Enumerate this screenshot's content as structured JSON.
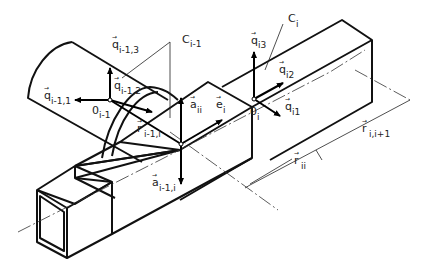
{
  "figure": {
    "labels": {
      "C_prev": {
        "base": "C",
        "sub": "i-1"
      },
      "C_curr": {
        "base": "C",
        "sub": "i"
      },
      "q_prev_3": {
        "base": "q",
        "sub": "i-1,3"
      },
      "q_prev_2": {
        "base": "q",
        "sub": "i-1,2"
      },
      "q_prev_1": {
        "base": "q",
        "sub": "i-1,1"
      },
      "O_prev": {
        "base": "0",
        "sub": "i-1"
      },
      "r_prev": {
        "base": "r",
        "sub": "i-1,i"
      },
      "a_ii": {
        "base": "a",
        "sub": "ii"
      },
      "e_i": {
        "base": "e",
        "sub": "i"
      },
      "a_prev": {
        "base": "a",
        "sub": "i-1,i"
      },
      "q_i3": {
        "base": "q",
        "sub": "i3"
      },
      "q_i2": {
        "base": "q",
        "sub": "i2"
      },
      "q_i1": {
        "base": "q",
        "sub": "i1"
      },
      "O_i": {
        "base": "0",
        "sub": "i"
      },
      "r_next": {
        "base": "r",
        "sub": "i,i+1"
      },
      "r_ii": {
        "base": "r",
        "sub": "ii"
      }
    },
    "vector_mark": "→"
  }
}
